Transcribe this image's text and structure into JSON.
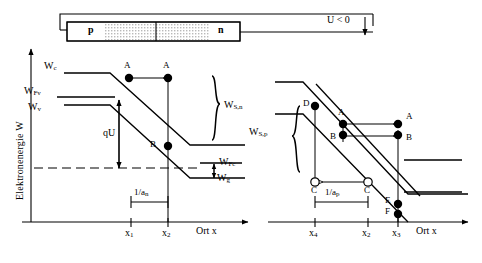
{
  "figure": {
    "domain": "semiconductor-band-diagram",
    "axis": {
      "y_title": "Elektronenergie W",
      "x_title_left": "Ort x",
      "x_title_right": "Ort x"
    },
    "circuit": {
      "p_label": "p",
      "n_label": "n",
      "bias_label": "U < 0"
    },
    "left_panel": {
      "band_labels": {
        "wc": "W",
        "wc_sub": "c",
        "wfv": "W",
        "wfv_sub": "Fv",
        "wv": "W",
        "wv_sub": "v",
        "wfc": "W",
        "wfc_sub": "Fc",
        "wg": "W",
        "wg_sub": "g"
      },
      "qu_label": "qU",
      "work_label": "W",
      "work_sub": "S,n",
      "width_label": "1/a",
      "width_sub": "n",
      "ticks": [
        {
          "label": "x",
          "sub": "1"
        },
        {
          "label": "x",
          "sub": "2"
        }
      ],
      "carriers": [
        {
          "id": "A-left",
          "label": "A",
          "type": "electron"
        },
        {
          "id": "A-right",
          "label": "A",
          "type": "electron"
        },
        {
          "id": "B",
          "label": "B",
          "type": "electron"
        }
      ]
    },
    "right_panel": {
      "work_label": "W",
      "work_sub": "S,p",
      "width_label": "1/a",
      "width_sub": "p",
      "ticks": [
        {
          "label": "x",
          "sub": "4"
        },
        {
          "label": "x",
          "sub": "2"
        },
        {
          "label": "x",
          "sub": "3"
        }
      ],
      "carriers": [
        {
          "id": "D",
          "label": "D",
          "type": "electron"
        },
        {
          "id": "A-left",
          "label": "A",
          "type": "electron"
        },
        {
          "id": "B-left",
          "label": "B",
          "type": "electron"
        },
        {
          "id": "A-right",
          "label": "A",
          "type": "electron"
        },
        {
          "id": "B-right",
          "label": "B",
          "type": "electron"
        },
        {
          "id": "C-left",
          "label": "C",
          "type": "hole"
        },
        {
          "id": "C-right",
          "label": "C",
          "type": "hole"
        },
        {
          "id": "E",
          "label": "E",
          "type": "electron"
        },
        {
          "id": "F",
          "label": "F",
          "type": "electron"
        }
      ]
    },
    "colors": {
      "ink": "#000000",
      "fill_shade": "#d9d9d9",
      "paper": "#ffffff"
    }
  }
}
